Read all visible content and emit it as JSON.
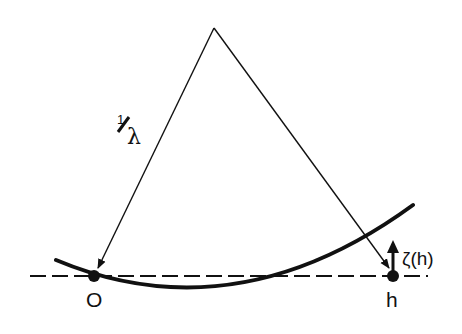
{
  "diagram": {
    "labels": {
      "origin": "O",
      "point_h": "h",
      "zeta": "ζ(h)",
      "inverse_lambda_num": "1",
      "inverse_lambda_den": "λ"
    },
    "colors": {
      "stroke": "#111111",
      "background": "#ffffff"
    }
  }
}
